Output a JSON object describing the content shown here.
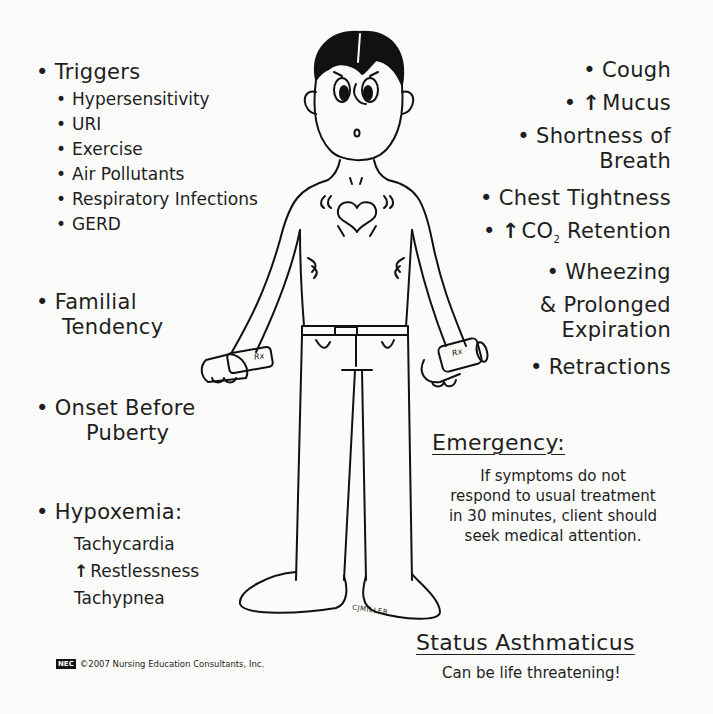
{
  "left": {
    "triggers": {
      "title": "Triggers",
      "items": [
        "Hypersensitivity",
        "URI",
        "Exercise",
        "Air Pollutants",
        "Respiratory Infections",
        "GERD"
      ]
    },
    "familial": [
      "Familial",
      "Tendency"
    ],
    "onset": [
      "Onset Before",
      "Puberty"
    ],
    "hypoxemia": {
      "title": "Hypoxemia:",
      "items": [
        "Tachycardia",
        "Restlessness",
        "Tachypnea"
      ],
      "arrow": "↑"
    }
  },
  "right": {
    "cough": "Cough",
    "mucus": "Mucus",
    "mucus_arrow": "↑",
    "sob": [
      "Shortness of",
      "Breath"
    ],
    "chest": "Chest Tightness",
    "co2_arrow": "↑",
    "co2_prefix": "CO",
    "co2_sub": "2",
    "co2_suffix": " Retention",
    "wheezing": "Wheezing",
    "prolonged": [
      "& Prolonged",
      "Expiration"
    ],
    "retractions": "Retractions"
  },
  "emergency": {
    "title": "Emergency:",
    "lines": [
      "If symptoms do not",
      "respond to usual treatment",
      "in 30 minutes, client should",
      "seek medical attention."
    ]
  },
  "status": {
    "title": "Status Asthmaticus",
    "subtitle": "Can be life threatening!"
  },
  "footer": {
    "logo": "NEC",
    "copyright": "©2007 Nursing Education Consultants, Inc."
  },
  "figure": {
    "signature": "CJMILLER",
    "inhaler_label": "Rx"
  }
}
